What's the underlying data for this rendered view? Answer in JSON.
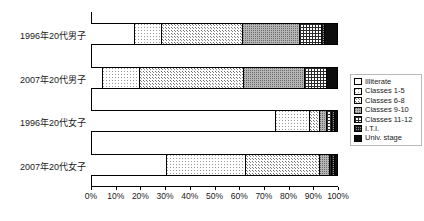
{
  "chart_data": {
    "type": "bar",
    "orientation": "horizontal",
    "stacked": true,
    "normalized": true,
    "title": "",
    "subtitle": "",
    "xlabel": "",
    "ylabel": "",
    "xlim": [
      0,
      100
    ],
    "grid": false,
    "legend_position": "right",
    "categories": [
      "1996年20代男子",
      "2007年20代男子",
      "1996年20代女子",
      "2007年20代女子"
    ],
    "xtick_labels": [
      "0%",
      "10%",
      "20%",
      "30%",
      "40%",
      "50%",
      "60%",
      "70%",
      "80%",
      "90%",
      "100%"
    ],
    "xtick_values": [
      0,
      10,
      20,
      30,
      40,
      50,
      60,
      70,
      80,
      90,
      100
    ],
    "series": [
      {
        "name": "Illiterate",
        "pattern": "p-illiterate",
        "values": [
          18,
          5,
          75,
          31
        ]
      },
      {
        "name": "Classes 1-5",
        "pattern": "p-c15",
        "values": [
          11,
          15,
          14,
          32
        ]
      },
      {
        "name": "Classes 6-8",
        "pattern": "p-c68",
        "values": [
          33,
          42,
          4,
          30
        ]
      },
      {
        "name": "Classes 9-10",
        "pattern": "p-c910",
        "values": [
          23,
          25,
          3,
          4
        ]
      },
      {
        "name": "Classes 11-12",
        "pattern": "p-c1112",
        "values": [
          9,
          9,
          2,
          1
        ]
      },
      {
        "name": "I.T.I.",
        "pattern": "p-iti",
        "values": [
          1,
          0,
          1,
          1
        ]
      },
      {
        "name": "Univ. stage",
        "pattern": "p-univ",
        "values": [
          5,
          4,
          1,
          1
        ]
      }
    ],
    "legend_entries": [
      "Illiterate",
      "Classes 1-5",
      "Classes 6-8",
      "Classes 9-10",
      "Classes 11-12",
      "I.T.I.",
      "Univ. stage"
    ]
  }
}
